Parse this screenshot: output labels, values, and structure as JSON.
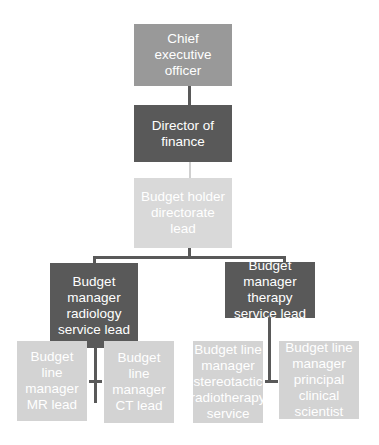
{
  "diagram": {
    "type": "org-chart",
    "colors": {
      "level1": "#999999",
      "level2": "#595959",
      "level3": "#d9d9d9",
      "level4": "#595959",
      "level5": "#d3d3d3",
      "connector_dark": "#595959",
      "connector_light": "#d0d0d0"
    },
    "nodes": {
      "ceo": "Chief executive officer",
      "finance_director": "Director of finance",
      "budget_holder": "Budget holder directorate lead",
      "radiology_manager": "Budget manager radiology service lead",
      "therapy_manager": "Budget manager therapy service lead",
      "mr_lead": "Budget line manager MR lead",
      "ct_lead": "Budget line manager CT lead",
      "stereotactic_manager": "Budget line manager stereotactic radiotherapy service",
      "clinical_scientist": "Budget line manager principal clinical scientist"
    }
  }
}
